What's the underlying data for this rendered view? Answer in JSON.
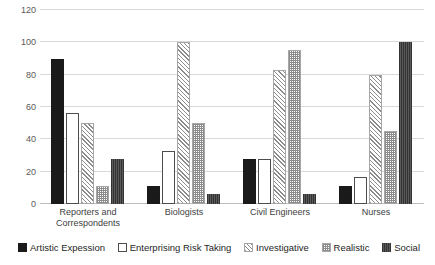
{
  "chart_data": {
    "type": "bar",
    "title": "",
    "subtitle": "",
    "xlabel": "",
    "ylabel": "",
    "ylim": [
      0,
      120
    ],
    "yticks": [
      0,
      20,
      40,
      60,
      80,
      100,
      120
    ],
    "grid": true,
    "legend_position": "bottom",
    "categories": [
      "Reporters and Correspondents",
      "Biologists",
      "Civil Engineers",
      "Nurses"
    ],
    "category_lines": [
      [
        "Reporters and",
        "Correspondents"
      ],
      [
        "Biologists",
        ""
      ],
      [
        "Civil Engineers",
        ""
      ],
      [
        "Nurses",
        ""
      ]
    ],
    "series": [
      {
        "name": "Artistic Expession",
        "pattern": "solid-black",
        "color": "#1a1a1a",
        "values": [
          90,
          11,
          28,
          11
        ]
      },
      {
        "name": "Enterprising Risk Taking",
        "pattern": "outline-white",
        "color": "#ffffff",
        "values": [
          56,
          33,
          28,
          17
        ]
      },
      {
        "name": "Investigative",
        "pattern": "diagonal-hatch",
        "color": "#8c8c8c",
        "values": [
          50,
          100,
          83,
          80
        ]
      },
      {
        "name": "Realistic",
        "pattern": "checker",
        "color": "#8c8c8c",
        "values": [
          11,
          50,
          95,
          45
        ]
      },
      {
        "name": "Social",
        "pattern": "dark-vertical",
        "color": "#4d4d4d",
        "values": [
          28,
          6,
          6,
          100
        ]
      }
    ]
  },
  "legend": {
    "items": [
      {
        "label": "Artistic Expession"
      },
      {
        "label": "Enterprising Risk Taking"
      },
      {
        "label": "Investigative"
      },
      {
        "label": "Realistic"
      },
      {
        "label": "Social"
      }
    ]
  },
  "axis": {
    "y_tick_labels": [
      "0",
      "20",
      "40",
      "60",
      "80",
      "100",
      "120"
    ]
  }
}
